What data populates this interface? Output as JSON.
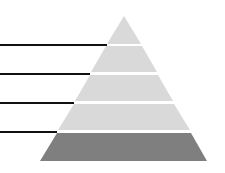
{
  "diagram": {
    "type": "pyramid",
    "levels": [
      {
        "index": 1,
        "label": "",
        "color": "#d9d9d9"
      },
      {
        "index": 2,
        "label": "",
        "color": "#d9d9d9"
      },
      {
        "index": 3,
        "label": "",
        "color": "#d9d9d9"
      },
      {
        "index": 4,
        "label": "",
        "color": "#d9d9d9"
      },
      {
        "index": 5,
        "label": "",
        "color": "#7f7f7f"
      }
    ],
    "leader_line_color": "#111111",
    "separator_color": "#ffffff"
  }
}
